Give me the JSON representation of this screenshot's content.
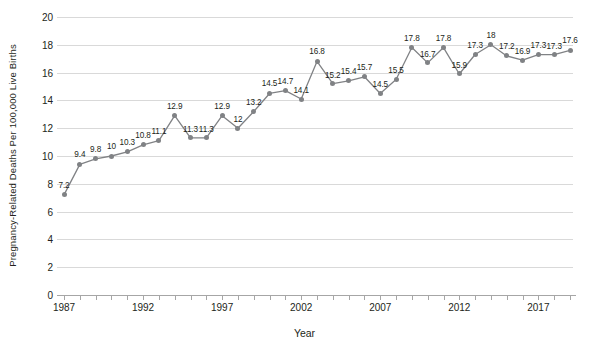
{
  "chart_data": {
    "type": "line",
    "title": "",
    "xlabel": "Year",
    "ylabel": "Pregnancy-Related Deaths Per 100,000 Live Births",
    "x": [
      1987,
      1988,
      1989,
      1990,
      1991,
      1992,
      1993,
      1994,
      1995,
      1996,
      1997,
      1998,
      1999,
      2000,
      2001,
      2002,
      2003,
      2004,
      2005,
      2006,
      2007,
      2008,
      2009,
      2010,
      2011,
      2012,
      2013,
      2014,
      2015,
      2016,
      2017,
      2018,
      2019
    ],
    "values": [
      7.2,
      9.4,
      9.8,
      10,
      10.3,
      10.8,
      11.1,
      12.9,
      11.3,
      11.3,
      12.9,
      12,
      13.2,
      14.5,
      14.7,
      14.1,
      16.8,
      15.2,
      15.4,
      15.7,
      14.5,
      15.5,
      17.8,
      16.7,
      17.8,
      15.9,
      17.3,
      18,
      17.2,
      16.9,
      17.3,
      17.3,
      17.6
    ],
    "point_labels": [
      "7.2",
      "9.4",
      "9.8",
      "10",
      "10.3",
      "10.8",
      "11.1",
      "12.9",
      "11.3",
      "11.3",
      "12.9",
      "12",
      "13.2",
      "14.5",
      "14.7",
      "14.1",
      "16.8",
      "15.2",
      "15.4",
      "15.7",
      "14.5",
      "15.5",
      "17.8",
      "16.7",
      "17.8",
      "15.9",
      "17.3",
      "18",
      "17.2",
      "16.9",
      "17.3",
      "17.3",
      "17.6"
    ],
    "ylim": [
      0,
      20
    ],
    "ytick_values": [
      0,
      2,
      4,
      6,
      8,
      10,
      12,
      14,
      16,
      18,
      20
    ],
    "ytick_labels": [
      "0",
      "2",
      "4",
      "6",
      "8",
      "10",
      "12",
      "14",
      "16",
      "18",
      "20"
    ],
    "xtick_values": [
      1987,
      1992,
      1997,
      2002,
      2007,
      2012,
      2017
    ],
    "xtick_labels": [
      "1987",
      "1992",
      "1997",
      "2002",
      "2007",
      "2012",
      "2017"
    ],
    "xlim": [
      1987,
      2019
    ],
    "grid": true,
    "legend": "none",
    "series_color": "#808285",
    "grid_color": "#d9d9d9",
    "background_color": "#ffffff"
  }
}
